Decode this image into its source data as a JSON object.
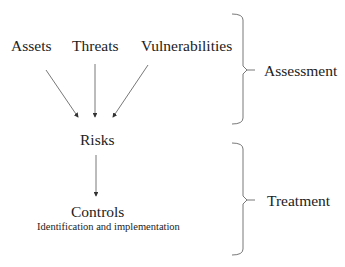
{
  "diagram": {
    "inputs": [
      {
        "label": "Assets"
      },
      {
        "label": "Threats"
      },
      {
        "label": "Vulnerabilities"
      }
    ],
    "risks": {
      "label": "Risks"
    },
    "controls": {
      "label": "Controls",
      "subtitle": "Identification and implementation"
    },
    "phases": [
      {
        "label": "Assessment"
      },
      {
        "label": "Treatment"
      }
    ],
    "line_color": "#555555"
  }
}
